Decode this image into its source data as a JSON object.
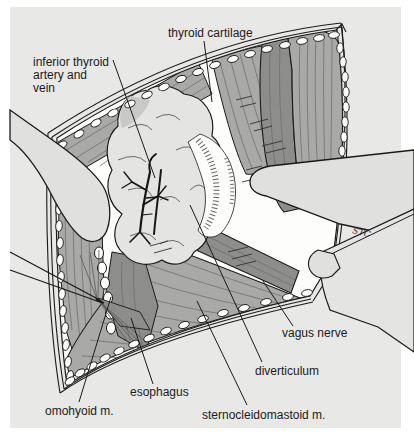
{
  "figure": {
    "signature": "STC",
    "colors": {
      "page_background": "#ffffff",
      "panel_background": "#e8e8e6",
      "wound_interior": "#fdfdfb",
      "muscle_medium": "#a9a9a8",
      "muscle_dark": "#8d8d8c",
      "retractor": "#e0e0de",
      "ink": "#1a1a1a"
    },
    "labels": {
      "thyroid_cartilage": {
        "text": "thyroid cartilage"
      },
      "inferior_thyroid": {
        "lines": [
          "inferior thyroid",
          "artery and",
          "vein"
        ]
      },
      "vagus_nerve": {
        "text": "vagus nerve"
      },
      "diverticulum": {
        "text": "diverticulum"
      },
      "esophagus": {
        "text": "esophagus"
      },
      "omohyoid": {
        "text": "omohyoid m."
      },
      "sternocleidomastoid": {
        "text": "sternocleidomastoid m."
      }
    }
  }
}
